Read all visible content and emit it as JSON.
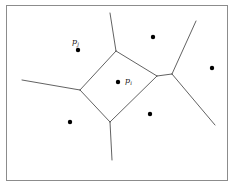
{
  "figure": {
    "kind": "voronoi-diagram",
    "caption": "",
    "width": 233,
    "height": 186,
    "background_color": "#ffffff",
    "frame": {
      "color": "#8c8c8c",
      "stroke_width": 1,
      "x": 6,
      "y": 5,
      "w": 221,
      "h": 175
    },
    "edge_color": "#3a3a3a",
    "edge_width": 0.8,
    "site_color": "#000000",
    "site_radius": 2.2
  },
  "chart_data": {
    "type": "scatter",
    "title": "",
    "xlabel": "",
    "ylabel": "",
    "xlim": [
      0,
      233
    ],
    "ylim": [
      0,
      186
    ],
    "grid": false,
    "legend": null,
    "sites": [
      {
        "id": "p_j",
        "label": "p",
        "sub": "j",
        "x": 78,
        "y": 50,
        "labeled": true,
        "label_dx": -6,
        "label_dy": -12
      },
      {
        "id": "p_i",
        "label": "p",
        "sub": "i",
        "x": 118,
        "y": 82,
        "labeled": true,
        "label_dx": 7,
        "label_dy": -5
      },
      {
        "id": "site_3",
        "label": "",
        "sub": "",
        "x": 153,
        "y": 37,
        "labeled": false,
        "label_dx": 0,
        "label_dy": 0
      },
      {
        "id": "site_4",
        "label": "",
        "sub": "",
        "x": 212,
        "y": 68,
        "labeled": false,
        "label_dx": 0,
        "label_dy": 0
      },
      {
        "id": "site_5",
        "label": "",
        "sub": "",
        "x": 150,
        "y": 114,
        "labeled": false,
        "label_dx": 0,
        "label_dy": 0
      },
      {
        "id": "site_6",
        "label": "",
        "sub": "",
        "x": 70,
        "y": 122,
        "labeled": false,
        "label_dx": 0,
        "label_dy": 0
      }
    ],
    "vertices": [
      {
        "id": "v_top",
        "x": 116,
        "y": 51
      },
      {
        "id": "v_left",
        "x": 80,
        "y": 90
      },
      {
        "id": "v_bottom",
        "x": 110,
        "y": 122
      },
      {
        "id": "v_right",
        "x": 157,
        "y": 76
      },
      {
        "id": "v_rnode",
        "x": 172,
        "y": 74
      }
    ],
    "edges": [
      {
        "id": "e_cell_top_left",
        "x1": 116,
        "y1": 51,
        "x2": 80,
        "y2": 90
      },
      {
        "id": "e_cell_left_bottom",
        "x1": 80,
        "y1": 90,
        "x2": 110,
        "y2": 122
      },
      {
        "id": "e_cell_bottom_right",
        "x1": 110,
        "y1": 122,
        "x2": 157,
        "y2": 76
      },
      {
        "id": "e_cell_right_top",
        "x1": 157,
        "y1": 76,
        "x2": 116,
        "y2": 51
      },
      {
        "id": "e_right_bridge",
        "x1": 157,
        "y1": 76,
        "x2": 172,
        "y2": 74
      },
      {
        "id": "e_top_ray",
        "x1": 116,
        "y1": 51,
        "x2": 110,
        "y2": 13
      },
      {
        "id": "e_left_ray",
        "x1": 80,
        "y1": 90,
        "x2": 22,
        "y2": 80
      },
      {
        "id": "e_bottom_ray",
        "x1": 110,
        "y1": 122,
        "x2": 112,
        "y2": 160
      },
      {
        "id": "e_upper_right_ray",
        "x1": 172,
        "y1": 74,
        "x2": 196,
        "y2": 21
      },
      {
        "id": "e_lower_right_ray",
        "x1": 172,
        "y1": 74,
        "x2": 215,
        "y2": 125
      }
    ]
  }
}
